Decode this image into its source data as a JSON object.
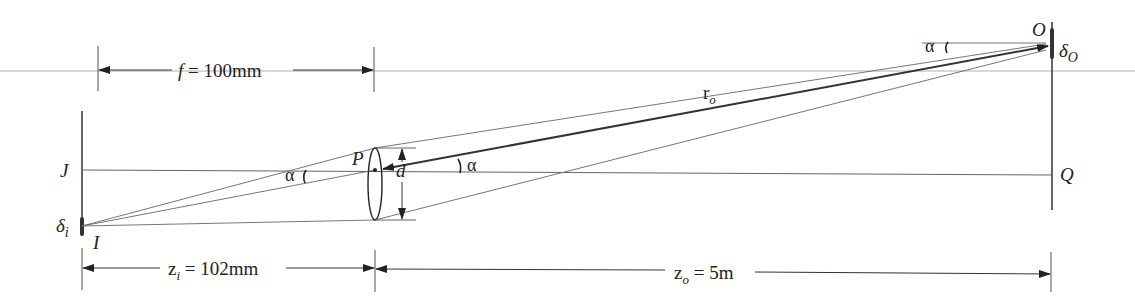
{
  "diagram": {
    "type": "thin-lens imaging geometry",
    "points": {
      "O": "O",
      "Q": "Q",
      "J": "J",
      "I": "I",
      "P": "P"
    },
    "labels": {
      "delta_o_base": "δ",
      "delta_o_sub": "O",
      "delta_i_base": "δ",
      "delta_i_sub": "i",
      "r_o_base": "r",
      "r_o_sub": "o",
      "d": "d",
      "alpha_image_side": "α",
      "alpha_lens": "α",
      "alpha_object": "α"
    },
    "dimensions": {
      "focal_length": {
        "symbol": "f",
        "text": " = 100mm"
      },
      "image_distance": {
        "base": "z",
        "sub": "i",
        "text": " = 102mm"
      },
      "object_distance": {
        "base": "z",
        "sub": "o",
        "text": " = 5m"
      }
    },
    "colors": {
      "ink": "#222222",
      "thin_line": "#555555",
      "axis_gray": "#aaaaaa"
    }
  }
}
